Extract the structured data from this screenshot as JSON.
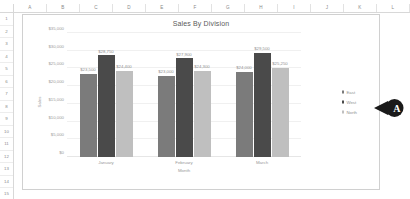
{
  "spreadsheet": {
    "columns": [
      "A",
      "B",
      "C",
      "D",
      "E",
      "F",
      "G",
      "H",
      "I",
      "J",
      "K",
      "L"
    ],
    "rows": [
      "1",
      "2",
      "3",
      "4",
      "5",
      "6",
      "7",
      "8",
      "9",
      "10",
      "11",
      "12",
      "13",
      "14",
      "15"
    ]
  },
  "callout": {
    "letter": "A"
  },
  "colors": {
    "east": "#7b7b7b",
    "west": "#4a4a4a",
    "north": "#bfbfbf",
    "gridline": "#f0f0f0",
    "callout": "#1a1a1a"
  },
  "chart_data": {
    "type": "bar",
    "title": "Sales By Division",
    "xlabel": "Month",
    "ylabel": "Sales",
    "categories": [
      "January",
      "February",
      "March"
    ],
    "series": [
      {
        "name": "East",
        "color": "#7b7b7b",
        "values": [
          23500,
          28750,
          24400
        ],
        "labels": [
          "$23,500",
          "$28,750",
          "$24,400"
        ]
      },
      {
        "name": "West",
        "color": "#4a4a4a",
        "values": [
          23000,
          27900,
          24300
        ],
        "labels": [
          "$23,000",
          "$27,900",
          "$24,300"
        ]
      },
      {
        "name": "North",
        "color": "#bfbfbf",
        "values": [
          24000,
          29500,
          25250
        ],
        "labels": [
          "$24,000",
          "$29,500",
          "$25,250"
        ]
      }
    ],
    "grouping": "by-category",
    "category_series": [
      {
        "category": "January",
        "bars": [
          {
            "series": "East",
            "value": 23500,
            "label": "$23,500",
            "color": "#7b7b7b"
          },
          {
            "series": "West",
            "value": 28750,
            "label": "$28,750",
            "color": "#4a4a4a"
          },
          {
            "series": "North",
            "value": 24400,
            "label": "$24,400",
            "color": "#bfbfbf"
          }
        ]
      },
      {
        "category": "February",
        "bars": [
          {
            "series": "East",
            "value": 23000,
            "label": "$23,000",
            "color": "#7b7b7b"
          },
          {
            "series": "West",
            "value": 27900,
            "label": "$27,900",
            "color": "#4a4a4a"
          },
          {
            "series": "North",
            "value": 24300,
            "label": "$24,300",
            "color": "#bfbfbf"
          }
        ]
      },
      {
        "category": "March",
        "bars": [
          {
            "series": "East",
            "value": 24000,
            "label": "$24,000",
            "color": "#7b7b7b"
          },
          {
            "series": "West",
            "value": 29500,
            "label": "$29,500",
            "color": "#4a4a4a"
          },
          {
            "series": "North",
            "value": 25250,
            "label": "$25,250",
            "color": "#bfbfbf"
          }
        ]
      }
    ],
    "ylim": [
      0,
      35000
    ],
    "yticks": [
      35000,
      30000,
      25000,
      20000,
      15000,
      10000,
      5000,
      0
    ],
    "ytick_labels": [
      "$35,000",
      "$30,000",
      "$25,000",
      "$20,000",
      "$15,000",
      "$10,000",
      "$5,000",
      "$0"
    ],
    "grid": true,
    "legend_position": "right",
    "legend": [
      "East",
      "West",
      "North"
    ]
  }
}
